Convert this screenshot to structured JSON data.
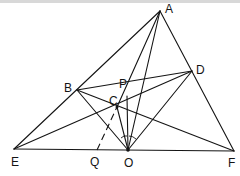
{
  "diagram": {
    "type": "geometry-figure",
    "points": {
      "A": {
        "label": "A",
        "x": 160,
        "y": 11
      },
      "B": {
        "label": "B",
        "x": 77,
        "y": 90
      },
      "C": {
        "label": "C",
        "x": 117,
        "y": 107
      },
      "D": {
        "label": "D",
        "x": 192,
        "y": 71
      },
      "E": {
        "label": "E",
        "x": 14,
        "y": 149
      },
      "F": {
        "label": "F",
        "x": 234,
        "y": 151
      },
      "O": {
        "label": "O",
        "x": 128,
        "y": 150
      },
      "P": {
        "label": "P",
        "x": 127,
        "y": 96
      },
      "Q": {
        "label": "Q",
        "x": 97,
        "y": 150
      }
    },
    "segments": [
      [
        "A",
        "E"
      ],
      [
        "A",
        "F"
      ],
      [
        "E",
        "F"
      ],
      [
        "A",
        "C"
      ],
      [
        "A",
        "O"
      ],
      [
        "B",
        "D"
      ],
      [
        "B",
        "F"
      ],
      [
        "B",
        "O"
      ],
      [
        "E",
        "D"
      ],
      [
        "D",
        "O"
      ],
      [
        "P",
        "O"
      ],
      [
        "C",
        "O"
      ]
    ],
    "dashed_segments": [
      [
        "Q",
        "C"
      ]
    ],
    "angle_marks": [
      {
        "vertex": "O",
        "count": 2
      }
    ],
    "labels": {
      "A": "A",
      "B": "B",
      "C": "C",
      "D": "D",
      "E": "E",
      "F": "F",
      "O": "O",
      "P": "P",
      "Q": "Q"
    }
  }
}
